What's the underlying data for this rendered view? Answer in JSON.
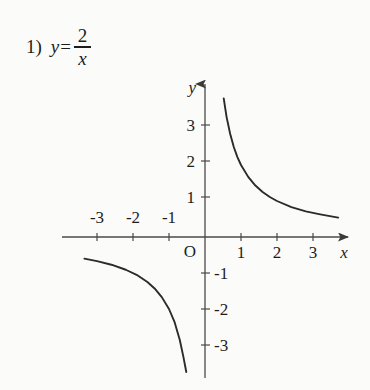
{
  "problem": {
    "number": "1)",
    "lhs": "y",
    "equals": "=",
    "numerator": "2",
    "denominator": "x"
  },
  "chart_data": {
    "type": "line",
    "function": "y = 2/x",
    "xlabel": "x",
    "ylabel": "y",
    "xlim": [
      -4.05,
      4.1
    ],
    "ylim": [
      -4.3,
      4.05
    ],
    "grid": false,
    "legend": null,
    "axes": {
      "origin_label": "O",
      "x_axis_arrow": true,
      "y_axis_arrow": true,
      "x_ticks": [
        -3,
        -2,
        -1,
        1,
        2,
        3
      ],
      "y_ticks": [
        3,
        2,
        1,
        -1,
        -2,
        -3
      ],
      "x_tick_labels": [
        "-3",
        "-2",
        "-1",
        "1",
        "2",
        "3"
      ],
      "y_tick_labels": [
        "3",
        "2",
        "1",
        "-1",
        "-2",
        "-3"
      ],
      "x_negative_labels_above_axis": true,
      "y_negative_labels_right_of_axis": true
    },
    "series": [
      {
        "name": "branch-quadrant-1",
        "x": [
          0.52,
          0.6,
          0.7,
          0.8,
          0.9,
          1.0,
          1.2,
          1.4,
          1.6,
          1.8,
          2.0,
          2.4,
          2.8,
          3.2,
          3.7
        ],
        "y": [
          3.85,
          3.33,
          2.86,
          2.5,
          2.22,
          2.0,
          1.67,
          1.43,
          1.25,
          1.11,
          1.0,
          0.83,
          0.71,
          0.63,
          0.54
        ]
      },
      {
        "name": "branch-quadrant-3",
        "x": [
          -3.35,
          -3.0,
          -2.6,
          -2.2,
          -1.9,
          -1.6,
          -1.4,
          -1.2,
          -1.0,
          -0.85,
          -0.7,
          -0.6,
          -0.52
        ],
        "y": [
          -0.6,
          -0.67,
          -0.77,
          -0.91,
          -1.05,
          -1.25,
          -1.43,
          -1.67,
          -2.0,
          -2.35,
          -2.86,
          -3.33,
          -3.75
        ]
      }
    ],
    "colors": {
      "curve": "#2b2b2b",
      "axis": "#4a4a4a",
      "background": "#fbfbf9",
      "text": "#1d1d1d"
    }
  }
}
